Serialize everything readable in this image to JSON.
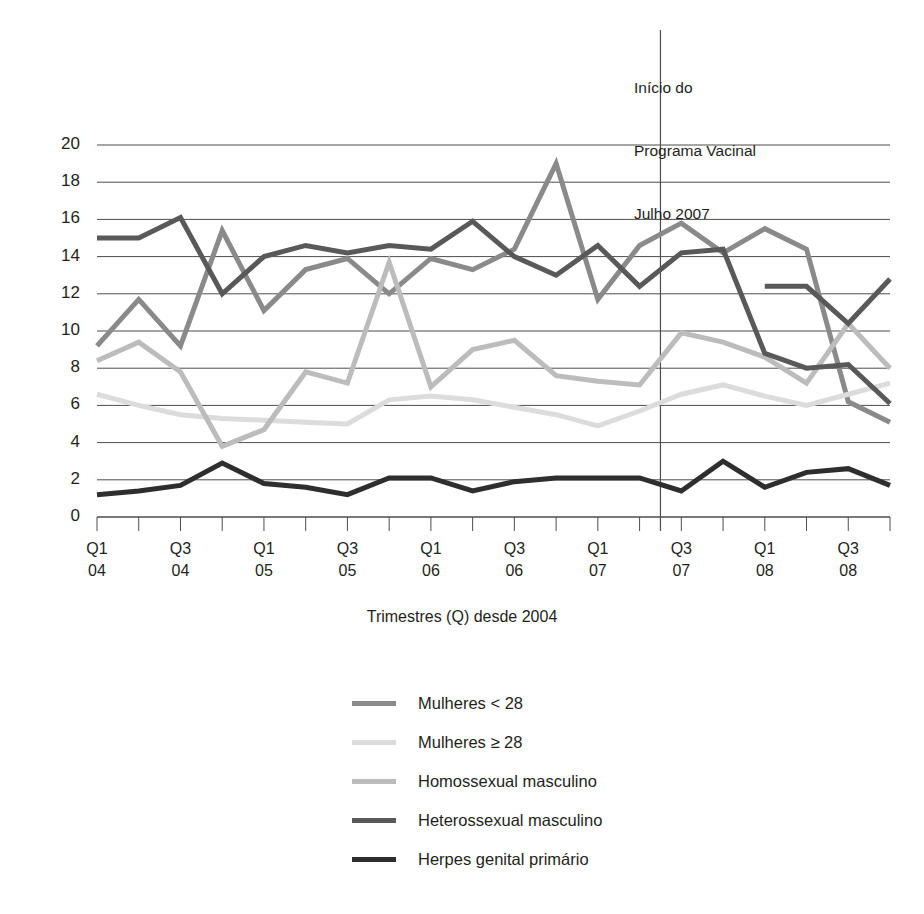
{
  "annotation": {
    "line1": "Início do",
    "line2": "Programa Vacinal",
    "line3": "Julho 2007"
  },
  "axis": {
    "x_title": "Trimestres (Q) desde 2004",
    "y_ticks": [
      "0",
      "2",
      "4",
      "6",
      "8",
      "10",
      "12",
      "14",
      "16",
      "18",
      "20"
    ],
    "x_tick_labels": [
      {
        "q": "Q1",
        "y": "04"
      },
      {
        "q": "Q3",
        "y": "04"
      },
      {
        "q": "Q1",
        "y": "05"
      },
      {
        "q": "Q3",
        "y": "05"
      },
      {
        "q": "Q1",
        "y": "06"
      },
      {
        "q": "Q3",
        "y": "06"
      },
      {
        "q": "Q1",
        "y": "07"
      },
      {
        "q": "Q3",
        "y": "07"
      },
      {
        "q": "Q1",
        "y": "08"
      },
      {
        "q": "Q3",
        "y": "08"
      }
    ]
  },
  "legend": {
    "items": [
      {
        "label": "Mulheres < 28",
        "color": "#8a8a8a"
      },
      {
        "label": "Mulheres ≥ 28",
        "color": "#dcdcdc"
      },
      {
        "label": "Homossexual masculino",
        "color": "#bcbcbc"
      },
      {
        "label": "Heterossexual masculino",
        "color": "#595959"
      },
      {
        "label": "Herpes genital primário",
        "color": "#2e2e2e"
      }
    ]
  },
  "chart_data": {
    "type": "line",
    "title": "",
    "xlabel": "Trimestres (Q) desde 2004",
    "ylabel": "",
    "xlim": [
      0,
      19
    ],
    "ylim": [
      0,
      20
    ],
    "grid": true,
    "legend_position": "bottom-center",
    "categories": [
      "Q1 04",
      "Q2 04",
      "Q3 04",
      "Q4 04",
      "Q1 05",
      "Q2 05",
      "Q3 05",
      "Q4 05",
      "Q1 06",
      "Q2 06",
      "Q3 06",
      "Q4 06",
      "Q1 07",
      "Q2 07",
      "Q3 07",
      "Q4 07",
      "Q1 08",
      "Q2 08",
      "Q3 08",
      "Q4 08"
    ],
    "annotations": [
      {
        "text": "Início do Programa Vacinal Julho 2007",
        "x_category": "Q2 07",
        "type": "vertical-line"
      }
    ],
    "series": [
      {
        "name": "Mulheres < 28",
        "color": "#8a8a8a",
        "values": [
          9.2,
          11.7,
          9.2,
          15.4,
          11.1,
          13.3,
          13.9,
          12.0,
          13.9,
          13.3,
          14.4,
          19.0,
          11.7,
          14.6,
          15.8,
          14.2,
          15.5,
          14.4,
          6.2,
          5.1
        ]
      },
      {
        "name": "Mulheres ≥ 28",
        "color": "#dcdcdc",
        "values": [
          6.6,
          6.0,
          5.5,
          5.3,
          5.2,
          5.1,
          5.0,
          6.3,
          6.5,
          6.3,
          5.9,
          5.5,
          4.9,
          5.7,
          6.6,
          7.1,
          6.5,
          6.0,
          6.6,
          7.2
        ]
      },
      {
        "name": "Homossexual masculino",
        "color": "#bcbcbc",
        "values": [
          8.4,
          9.4,
          7.8,
          3.8,
          4.7,
          7.8,
          7.2,
          13.7,
          7.0,
          9.0,
          9.5,
          7.6,
          7.3,
          7.1,
          9.9,
          9.4,
          8.6,
          7.2,
          10.4,
          8.0
        ]
      },
      {
        "name": "Heterossexual masculino",
        "color": "#595959",
        "values": [
          15.0,
          15.0,
          16.1,
          12.0,
          14.0,
          14.6,
          14.2,
          14.6,
          14.4,
          15.9,
          14.0,
          13.0,
          14.6,
          12.4,
          14.2,
          14.4,
          8.8,
          8.0,
          8.2,
          6.1
        ]
      },
      {
        "name": "Herpes genital primário",
        "color": "#2e2e2e",
        "values": [
          1.2,
          1.4,
          1.7,
          2.9,
          1.8,
          1.6,
          1.2,
          2.1,
          2.1,
          1.4,
          1.9,
          2.1,
          2.1,
          2.1,
          1.4,
          3.0,
          1.6,
          2.4,
          2.6,
          1.7
        ]
      },
      {
        "name": "Heterossexual masculino (cont.)",
        "color": "#595959",
        "values": [
          null,
          null,
          null,
          null,
          null,
          null,
          null,
          null,
          null,
          null,
          null,
          null,
          null,
          null,
          null,
          null,
          12.4,
          12.4,
          10.4,
          12.8
        ]
      }
    ]
  }
}
